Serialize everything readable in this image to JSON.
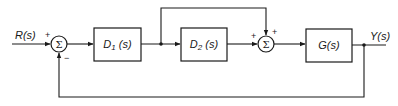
{
  "diagram": {
    "type": "block-diagram",
    "input": {
      "label": "R(s)"
    },
    "output": {
      "label": "Y(s)"
    },
    "summing_junctions": [
      {
        "id": "sum1",
        "symbol": "Σ",
        "signs": {
          "left": "+",
          "bottom": "−"
        }
      },
      {
        "id": "sum2",
        "symbol": "Σ",
        "signs": {
          "left": "+",
          "top": "+"
        }
      }
    ],
    "blocks": [
      {
        "id": "d1",
        "label_main": "D",
        "label_sub": "1",
        "label_tail": " (s)"
      },
      {
        "id": "d2",
        "label_main": "D",
        "label_sub": "2",
        "label_tail": " (s)"
      },
      {
        "id": "g",
        "label_main": "G(s)"
      }
    ],
    "connections": [
      "R(s) → sum1 (+)",
      "sum1 → D1(s)",
      "D1(s) → D2(s)",
      "D1(s) output → sum2 (+, top, feedforward)",
      "D2(s) → sum2 (+)",
      "sum2 → G(s)",
      "G(s) → Y(s)",
      "Y(s) → sum1 (−, unity feedback)"
    ]
  }
}
